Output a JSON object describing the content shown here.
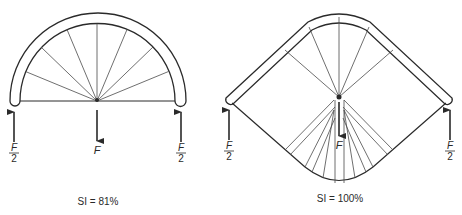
{
  "figures": [
    {
      "id": "left",
      "shape": "semicircular-arch",
      "caption": "SI = 81%",
      "load_label": "F",
      "support_left": {
        "numerator": "F",
        "denominator": "2"
      },
      "support_right": {
        "numerator": "F",
        "denominator": "2"
      }
    },
    {
      "id": "right",
      "shape": "rounded-diamond-arch",
      "caption": "SI = 100%",
      "load_label": "F",
      "support_left": {
        "numerator": "F",
        "denominator": "2"
      },
      "support_right": {
        "numerator": "F",
        "denominator": "2"
      }
    }
  ],
  "colors": {
    "stroke": "#2a2a2a",
    "spoke": "#4a4a4a",
    "background": "#ffffff"
  }
}
